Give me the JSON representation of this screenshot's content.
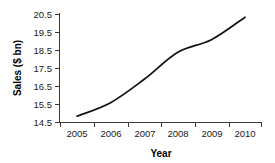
{
  "chart_data": {
    "type": "line",
    "title": "",
    "xlabel": "Year",
    "ylabel": "Sales ($ bn)",
    "categories": [
      "2005",
      "2006",
      "2007",
      "2008",
      "2009",
      "2010"
    ],
    "x": [
      2005,
      2006,
      2007,
      2008,
      2009,
      2010
    ],
    "values": [
      14.85,
      15.6,
      16.9,
      18.4,
      19.1,
      20.35
    ],
    "series": [
      {
        "name": "Sales",
        "values": [
          14.85,
          15.6,
          16.9,
          18.4,
          19.1,
          20.35
        ],
        "color": "#111111"
      }
    ],
    "ylim": [
      14.5,
      20.5
    ],
    "yticks": [
      14.5,
      15.5,
      16.5,
      17.5,
      18.5,
      19.5,
      20.5
    ],
    "ytick_labels": [
      "14.5",
      "15.5",
      "16.5",
      "17.5",
      "18.5",
      "19.5",
      "20.5"
    ],
    "xtick_labels": [
      "2005",
      "2006",
      "2007",
      "2008",
      "2009",
      "2010"
    ],
    "grid": false,
    "legend": "none",
    "background_color": "#ffffff",
    "axis_color": "#3a3a3a"
  }
}
